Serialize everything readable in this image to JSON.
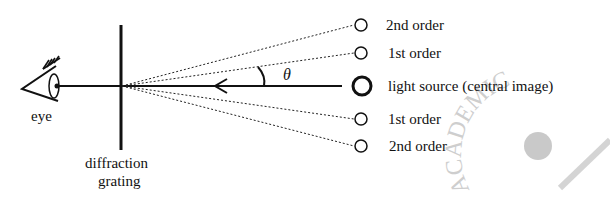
{
  "diagram": {
    "labels": {
      "eye": "eye",
      "grating_line1": "diffraction",
      "grating_line2": "grating",
      "angle": "θ"
    },
    "orders": [
      {
        "name": "2nd order (upper)",
        "label": "2nd order",
        "type": "diffracted"
      },
      {
        "name": "1st order (upper)",
        "label": "1st order",
        "type": "diffracted"
      },
      {
        "name": "central image",
        "label": "light source (central image)",
        "type": "source"
      },
      {
        "name": "1st order (lower)",
        "label": "1st order",
        "type": "diffracted"
      },
      {
        "name": "2nd order (lower)",
        "label": "2nd order",
        "type": "diffracted"
      }
    ],
    "watermark": "ACADEMIC",
    "colors": {
      "ink": "#111111",
      "watermark": "#c9c9c9",
      "background": "#ffffff"
    }
  }
}
